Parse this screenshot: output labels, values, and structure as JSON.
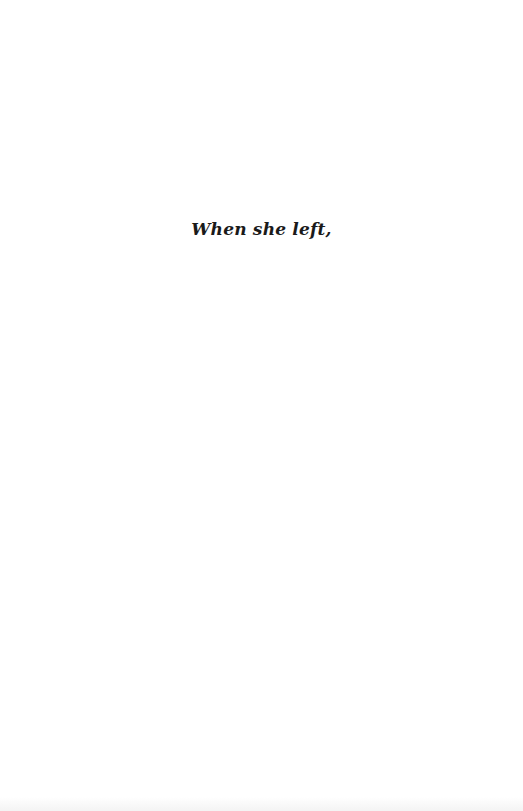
{
  "page": {
    "background_color": "#ffffff",
    "text_color": "#1a1a1a"
  },
  "content": {
    "epigraph": "When she left,"
  }
}
